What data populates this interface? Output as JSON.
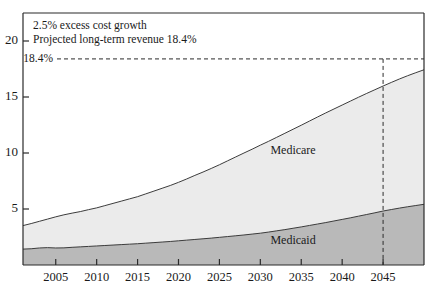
{
  "chart_data": {
    "type": "area",
    "title": "",
    "xlabel": "",
    "ylabel": "",
    "stacked": true,
    "grid": false,
    "legend_position": "inline-labels",
    "xlim": [
      2001,
      2050
    ],
    "ylim": [
      0,
      22.5
    ],
    "x_ticks": [
      2005,
      2010,
      2015,
      2020,
      2025,
      2030,
      2035,
      2040,
      2045
    ],
    "x_tick_labels": [
      "2005",
      "2010",
      "2015",
      "2020",
      "2025",
      "2030",
      "2035",
      "2040",
      "2045"
    ],
    "y_ticks": [
      5,
      10,
      15,
      20
    ],
    "y_tick_labels": [
      "5",
      "10",
      "15",
      "20"
    ],
    "x": [
      2001,
      2002,
      2003,
      2004,
      2005,
      2006,
      2007,
      2008,
      2009,
      2010,
      2011,
      2012,
      2013,
      2014,
      2015,
      2016,
      2017,
      2018,
      2019,
      2020,
      2021,
      2022,
      2023,
      2024,
      2025,
      2026,
      2027,
      2028,
      2029,
      2030,
      2031,
      2032,
      2033,
      2034,
      2035,
      2036,
      2037,
      2038,
      2039,
      2040,
      2041,
      2042,
      2043,
      2044,
      2045,
      2046,
      2047,
      2048,
      2049,
      2050
    ],
    "series": [
      {
        "name": "Medicaid",
        "color": "#b9b9b9",
        "values": [
          1.42,
          1.45,
          1.52,
          1.55,
          1.52,
          1.53,
          1.58,
          1.62,
          1.66,
          1.7,
          1.74,
          1.78,
          1.82,
          1.86,
          1.9,
          1.95,
          2.0,
          2.05,
          2.1,
          2.16,
          2.22,
          2.28,
          2.34,
          2.4,
          2.47,
          2.54,
          2.61,
          2.68,
          2.76,
          2.84,
          2.94,
          3.05,
          3.16,
          3.28,
          3.4,
          3.53,
          3.66,
          3.79,
          3.93,
          4.07,
          4.21,
          4.36,
          4.51,
          4.66,
          4.82,
          4.95,
          5.08,
          5.2,
          5.31,
          5.42
        ]
      },
      {
        "name": "Medicare",
        "color": "#ebebeb",
        "values": [
          2.1,
          2.25,
          2.38,
          2.55,
          2.78,
          2.95,
          3.05,
          3.15,
          3.28,
          3.4,
          3.56,
          3.72,
          3.88,
          4.04,
          4.2,
          4.4,
          4.6,
          4.8,
          5.0,
          5.22,
          5.46,
          5.72,
          5.96,
          6.22,
          6.48,
          6.76,
          7.04,
          7.32,
          7.58,
          7.86,
          8.1,
          8.35,
          8.6,
          8.84,
          9.08,
          9.32,
          9.56,
          9.79,
          10.0,
          10.21,
          10.42,
          10.62,
          10.81,
          10.99,
          11.16,
          11.35,
          11.53,
          11.7,
          11.86,
          12.01
        ]
      }
    ],
    "totals": [
      3.52,
      3.7,
      3.9,
      4.1,
      4.3,
      4.48,
      4.63,
      4.77,
      4.94,
      5.1,
      5.3,
      5.5,
      5.7,
      5.9,
      6.1,
      6.35,
      6.6,
      6.85,
      7.1,
      7.38,
      7.68,
      8.0,
      8.3,
      8.62,
      8.95,
      9.3,
      9.65,
      10.0,
      10.34,
      10.7,
      11.04,
      11.4,
      11.76,
      12.12,
      12.48,
      12.85,
      13.22,
      13.58,
      13.93,
      14.28,
      14.63,
      14.98,
      15.32,
      15.65,
      15.98,
      16.3,
      16.61,
      16.9,
      17.17,
      17.43
    ],
    "annotations": [
      {
        "name": "assumption-note-line1",
        "text": "2.5% excess cost growth"
      },
      {
        "name": "assumption-note-line2",
        "text": "Projected long-term revenue 18.4%"
      }
    ],
    "reference_lines": [
      {
        "name": "revenue-threshold",
        "axis": "y",
        "value": 18.4,
        "label": "18.4%",
        "style": "dashed"
      },
      {
        "name": "crossover-year",
        "axis": "x",
        "value": 2045,
        "label": "2045",
        "style": "dashed"
      }
    ],
    "series_labels": [
      {
        "name": "Medicare",
        "x": 2034,
        "y": 10.2
      },
      {
        "name": "Medicaid",
        "x": 2034,
        "y": 2.1
      }
    ]
  },
  "axis": {
    "y_reference_label": "18.4%"
  },
  "annotation_box": {
    "line1": "2.5% excess cost growth",
    "line2": "Projected long-term revenue 18.4%"
  },
  "labels": {
    "medicare": "Medicare",
    "medicaid": "Medicaid"
  },
  "colors": {
    "medicare_fill": "#ebebeb",
    "medicaid_fill": "#b9b9b9",
    "line": "#3c3c3c",
    "frame": "#2b2b2b",
    "text": "#1a1a1a"
  }
}
